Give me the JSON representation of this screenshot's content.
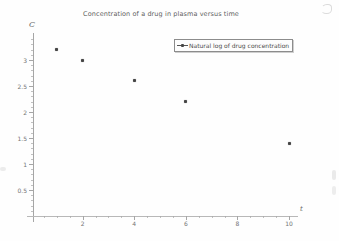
{
  "chart_data": {
    "type": "scatter",
    "title": "Concentration of a drug in plasma versus time",
    "xlabel": "t",
    "ylabel": "C",
    "series": [
      {
        "name": "Natural log of drug concentration",
        "x": [
          1,
          2,
          4,
          6,
          10
        ],
        "y": [
          3.2,
          3.0,
          2.6,
          2.2,
          1.4
        ]
      }
    ],
    "xlim": [
      0,
      10.3
    ],
    "ylim": [
      0,
      3.45
    ],
    "x_major_ticks": [
      2,
      4,
      6,
      8,
      10
    ],
    "y_major_ticks": [
      0.5,
      1,
      1.5,
      2,
      2.5,
      3
    ],
    "x_minor_step": 0.5,
    "y_minor_step": 0.1,
    "grid": false,
    "legend_position": "upper-right",
    "colors": {
      "marker": "#454545",
      "axis": "#a6a6a6",
      "tick_text": "#737373",
      "title_text": "#5e5e5e",
      "legend_border": "#8c8c8c",
      "legend_text": "#4b4b4b"
    }
  }
}
